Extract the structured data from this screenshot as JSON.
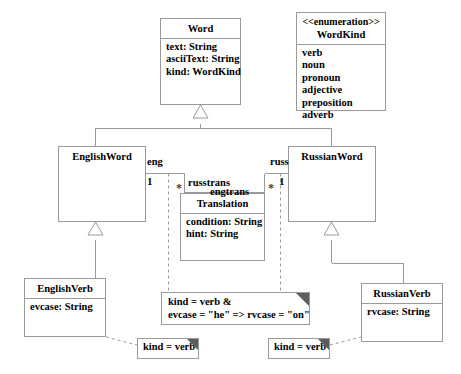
{
  "diagram": {
    "stroke_color": "#9a9a9a",
    "text_color": "#000000",
    "fold_color": "#5d5d5d",
    "background": "#ffffff"
  },
  "classes": {
    "word": {
      "name": "Word",
      "attributes": [
        "text: String",
        "asciiText: String",
        "kind: WordKind"
      ]
    },
    "word_kind": {
      "stereotype": "<<enumeration>>",
      "name": "WordKind",
      "literals": [
        "verb",
        "noun",
        "pronoun",
        "adjective",
        "preposition",
        "adverb"
      ]
    },
    "english_word": {
      "name": "EnglishWord",
      "attributes": []
    },
    "russian_word": {
      "name": "RussianWord",
      "attributes": []
    },
    "translation": {
      "name": "Translation",
      "attributes": [
        "condition: String",
        "hint: String"
      ]
    },
    "english_verb": {
      "name": "EnglishVerb",
      "attributes": [
        "evcase: String"
      ]
    },
    "russian_verb": {
      "name": "RussianVerb",
      "attributes": [
        "rvcase: String"
      ]
    }
  },
  "association": {
    "eng_role": "eng",
    "eng_multiplicity": "1",
    "russ_role": "russ",
    "russ_multiplicity": "1",
    "russtrans_role": "russtrans",
    "russtrans_multiplicity": "*",
    "engtrans_role": "engtrans",
    "engtrans_multiplicity": "*"
  },
  "notes": {
    "constraint": {
      "lines": [
        "kind = verb &",
        "evcase = \"he\" => rvcase = \"on\""
      ]
    },
    "english_verb_note": {
      "lines": [
        "kind = verb"
      ]
    },
    "russian_verb_note": {
      "lines": [
        "kind = verb"
      ]
    }
  }
}
